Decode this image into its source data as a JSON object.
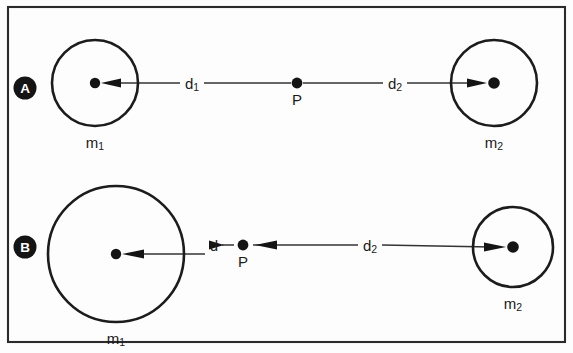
{
  "figure": {
    "background_color": "#fdfdfd",
    "border_color": "#2b2b2b",
    "ink_color": "#141414"
  },
  "panels": [
    {
      "id": "A",
      "badge_label": "A",
      "mass_left": {
        "label_base": "m",
        "label_sub": "1",
        "cx": 95,
        "cy": 83,
        "r": 43
      },
      "mass_right": {
        "label_base": "m",
        "label_sub": "2",
        "cx": 494,
        "cy": 83,
        "r": 43
      },
      "point": {
        "label": "P",
        "cx": 297,
        "cy": 83,
        "r": 5.4
      },
      "distance_left": {
        "label_base": "d",
        "label_sub": "1",
        "x": 192,
        "y": 83
      },
      "distance_right": {
        "label_base": "d",
        "label_sub": "2",
        "x": 395,
        "y": 83
      },
      "arrow_direction_left": "inward-to-mass",
      "arrow_direction_right": "inward-to-mass"
    },
    {
      "id": "B",
      "badge_label": "B",
      "mass_left": {
        "label_base": "m",
        "label_sub": "1",
        "cx": 116,
        "cy": 254,
        "r": 68
      },
      "mass_right": {
        "label_base": "m",
        "label_sub": "2",
        "cx": 513,
        "cy": 247,
        "r": 40
      },
      "point": {
        "label": "P",
        "cx": 243,
        "cy": 245,
        "r": 5.4
      },
      "distance_left": {
        "label_base": "d",
        "label_sub": "",
        "x": 214,
        "y": 245
      },
      "distance_right": {
        "label_base": "d",
        "label_sub": "2",
        "x": 370,
        "y": 245
      },
      "arrow_direction_left": "inward-to-mass",
      "arrow_direction_right": "inward-to-mass"
    }
  ],
  "frame": {
    "x": 8,
    "y": 7,
    "width": 557,
    "height": 335
  }
}
